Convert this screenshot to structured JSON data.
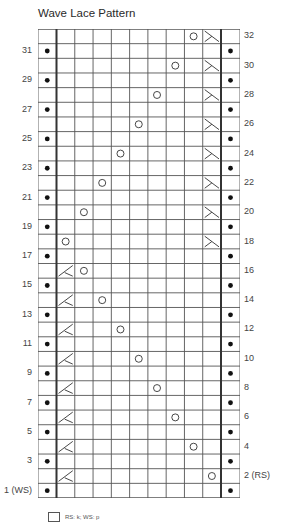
{
  "title": "Wave Lace Pattern",
  "chart": {
    "rows": 32,
    "pattern_columns": 9,
    "edge_columns": 2,
    "left_labels": [
      {
        "row": 31,
        "text": "31"
      },
      {
        "row": 29,
        "text": "29"
      },
      {
        "row": 27,
        "text": "27"
      },
      {
        "row": 25,
        "text": "25"
      },
      {
        "row": 23,
        "text": "23"
      },
      {
        "row": 21,
        "text": "21"
      },
      {
        "row": 19,
        "text": "19"
      },
      {
        "row": 17,
        "text": "17"
      },
      {
        "row": 15,
        "text": "15"
      },
      {
        "row": 13,
        "text": "13"
      },
      {
        "row": 11,
        "text": "11"
      },
      {
        "row": 9,
        "text": "9"
      },
      {
        "row": 7,
        "text": "7"
      },
      {
        "row": 5,
        "text": "5"
      },
      {
        "row": 3,
        "text": "3"
      },
      {
        "row": 1,
        "text": "1 (WS)"
      }
    ],
    "right_labels": [
      {
        "row": 32,
        "text": "32"
      },
      {
        "row": 30,
        "text": "30"
      },
      {
        "row": 28,
        "text": "28"
      },
      {
        "row": 26,
        "text": "26"
      },
      {
        "row": 24,
        "text": "24"
      },
      {
        "row": 22,
        "text": "22"
      },
      {
        "row": 20,
        "text": "20"
      },
      {
        "row": 18,
        "text": "18"
      },
      {
        "row": 16,
        "text": "16"
      },
      {
        "row": 14,
        "text": "14"
      },
      {
        "row": 12,
        "text": "12"
      },
      {
        "row": 10,
        "text": "10"
      },
      {
        "row": 8,
        "text": "8"
      },
      {
        "row": 6,
        "text": "6"
      },
      {
        "row": 4,
        "text": "4"
      },
      {
        "row": 2,
        "text": "2 (RS)"
      }
    ],
    "purl_bump_rows": "odd",
    "purl_bump_columns": [
      "left-edge",
      "right-edge"
    ],
    "symbols": [
      {
        "row": 2,
        "col": 1,
        "type": "decrease-left"
      },
      {
        "row": 2,
        "col": 9,
        "type": "yarn-over"
      },
      {
        "row": 4,
        "col": 1,
        "type": "decrease-left"
      },
      {
        "row": 4,
        "col": 8,
        "type": "yarn-over"
      },
      {
        "row": 6,
        "col": 1,
        "type": "decrease-left"
      },
      {
        "row": 6,
        "col": 7,
        "type": "yarn-over"
      },
      {
        "row": 8,
        "col": 1,
        "type": "decrease-left"
      },
      {
        "row": 8,
        "col": 6,
        "type": "yarn-over"
      },
      {
        "row": 10,
        "col": 1,
        "type": "decrease-left"
      },
      {
        "row": 10,
        "col": 5,
        "type": "yarn-over"
      },
      {
        "row": 12,
        "col": 1,
        "type": "decrease-left"
      },
      {
        "row": 12,
        "col": 4,
        "type": "yarn-over"
      },
      {
        "row": 14,
        "col": 1,
        "type": "decrease-left"
      },
      {
        "row": 14,
        "col": 3,
        "type": "yarn-over"
      },
      {
        "row": 16,
        "col": 1,
        "type": "decrease-left"
      },
      {
        "row": 16,
        "col": 2,
        "type": "yarn-over"
      },
      {
        "row": 18,
        "col": 9,
        "type": "decrease-right"
      },
      {
        "row": 18,
        "col": 1,
        "type": "yarn-over"
      },
      {
        "row": 20,
        "col": 9,
        "type": "decrease-right"
      },
      {
        "row": 20,
        "col": 2,
        "type": "yarn-over"
      },
      {
        "row": 22,
        "col": 9,
        "type": "decrease-right"
      },
      {
        "row": 22,
        "col": 3,
        "type": "yarn-over"
      },
      {
        "row": 24,
        "col": 9,
        "type": "decrease-right"
      },
      {
        "row": 24,
        "col": 4,
        "type": "yarn-over"
      },
      {
        "row": 26,
        "col": 9,
        "type": "decrease-right"
      },
      {
        "row": 26,
        "col": 5,
        "type": "yarn-over"
      },
      {
        "row": 28,
        "col": 9,
        "type": "decrease-right"
      },
      {
        "row": 28,
        "col": 6,
        "type": "yarn-over"
      },
      {
        "row": 30,
        "col": 9,
        "type": "decrease-right"
      },
      {
        "row": 30,
        "col": 7,
        "type": "yarn-over"
      },
      {
        "row": 32,
        "col": 9,
        "type": "decrease-right"
      },
      {
        "row": 32,
        "col": 8,
        "type": "yarn-over"
      }
    ]
  },
  "legend": {
    "items": [
      {
        "icon": "knit-square-icon",
        "text": "RS: k; WS: p"
      }
    ]
  }
}
